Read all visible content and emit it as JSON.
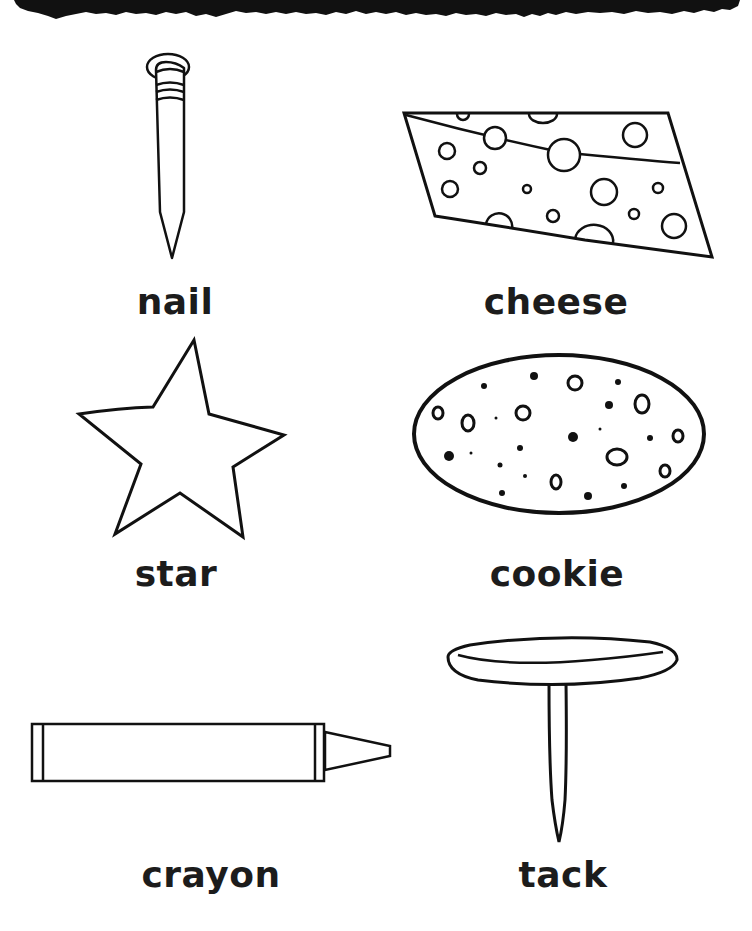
{
  "worksheet": {
    "header": {
      "style": "torn-black-brush-strip",
      "color": "#111111"
    },
    "items": [
      {
        "id": "nail",
        "label": "nail",
        "icon": "nail-icon",
        "column": "left",
        "row": 1
      },
      {
        "id": "cheese",
        "label": "cheese",
        "icon": "cheese-icon",
        "column": "right",
        "row": 1
      },
      {
        "id": "star",
        "label": "star",
        "icon": "star-icon",
        "column": "left",
        "row": 2
      },
      {
        "id": "cookie",
        "label": "cookie",
        "icon": "cookie-icon",
        "column": "right",
        "row": 2
      },
      {
        "id": "crayon",
        "label": "crayon",
        "icon": "crayon-icon",
        "column": "left",
        "row": 3
      },
      {
        "id": "tack",
        "label": "tack",
        "icon": "tack-icon",
        "column": "right",
        "row": 3
      }
    ],
    "colors": {
      "line": "#111111",
      "text": "#1c1c1c",
      "background": "#ffffff"
    }
  }
}
